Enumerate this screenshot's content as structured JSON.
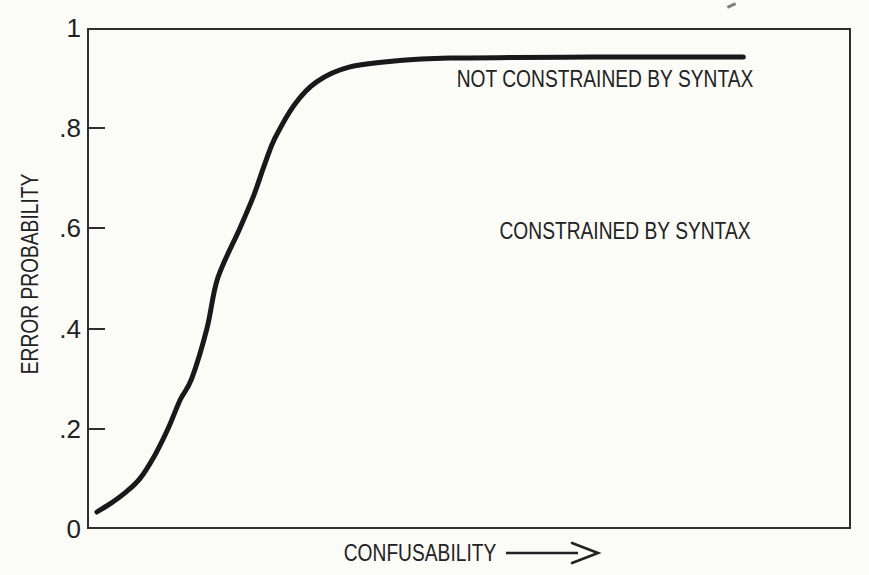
{
  "figure": {
    "background": "#fbfbf8",
    "ink": "#222222",
    "curve_color": "#191919",
    "axis_color": "#2e2e2e"
  },
  "chart_data": {
    "type": "line",
    "xlabel": "CONFUSABILITY",
    "ylabel": "ERROR PROBABILITY",
    "ylim": [
      0,
      1
    ],
    "grid": false,
    "x_axis_arrow": true,
    "x_tick_labels": [],
    "y_ticks": [
      {
        "label": "1",
        "value": 1.0,
        "tick_mark": false
      },
      {
        "label": ".8",
        "value": 0.8,
        "tick_mark": true
      },
      {
        "label": ".6",
        "value": 0.6,
        "tick_mark": true
      },
      {
        "label": ".4",
        "value": 0.4,
        "tick_mark": true
      },
      {
        "label": ".2",
        "value": 0.2,
        "tick_mark": true
      },
      {
        "label": "0",
        "value": 0.0,
        "tick_mark": false
      }
    ],
    "series": [
      {
        "name": "error probability vs confusability (sigmoid)",
        "x_units": "fraction of axis width (axis unlabeled)",
        "points": [
          [
            0.013,
            0.034
          ],
          [
            0.03,
            0.05
          ],
          [
            0.048,
            0.07
          ],
          [
            0.069,
            0.1
          ],
          [
            0.089,
            0.148
          ],
          [
            0.106,
            0.2
          ],
          [
            0.122,
            0.258
          ],
          [
            0.137,
            0.3
          ],
          [
            0.157,
            0.4
          ],
          [
            0.171,
            0.5
          ],
          [
            0.2,
            0.6
          ],
          [
            0.218,
            0.665
          ],
          [
            0.233,
            0.73
          ],
          [
            0.246,
            0.78
          ],
          [
            0.272,
            0.848
          ],
          [
            0.301,
            0.893
          ],
          [
            0.343,
            0.922
          ],
          [
            0.409,
            0.935
          ],
          [
            0.475,
            0.94
          ],
          [
            0.56,
            0.941
          ],
          [
            0.66,
            0.942
          ],
          [
            0.76,
            0.942
          ],
          [
            0.859,
            0.942
          ]
        ]
      }
    ],
    "annotations": [
      {
        "text": "NOT CONSTRAINED BY SYNTAX",
        "x_frac": 0.678,
        "y_prob": 0.898
      },
      {
        "text": "CONSTRAINED BY SYNTAX",
        "x_frac": 0.704,
        "y_prob": 0.595
      }
    ]
  }
}
